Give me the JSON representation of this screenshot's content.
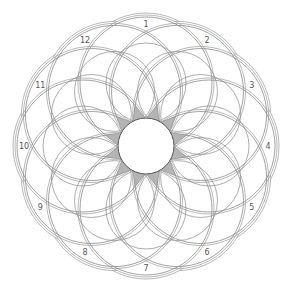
{
  "diagram": {
    "type": "rosette",
    "center": [
      146,
      146
    ],
    "petal_count": 12,
    "labels": [
      "1",
      "2",
      "3",
      "4",
      "5",
      "6",
      "7",
      "8",
      "9",
      "10",
      "11",
      "12"
    ],
    "colors": {
      "background": "#ffffff",
      "line": "#8a8a8a",
      "border": "#9a9a9a",
      "star_fill": "#b4b4b4",
      "label": "#555555"
    }
  }
}
